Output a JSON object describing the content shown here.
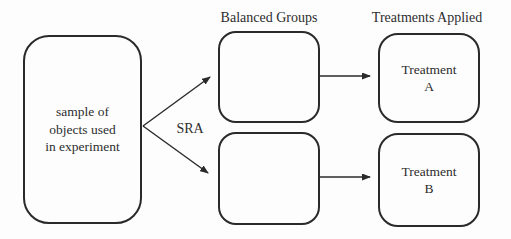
{
  "diagram": {
    "column_labels": {
      "balanced_groups": "Balanced Groups",
      "treatments_applied": "Treatments Applied"
    },
    "nodes": {
      "sample": {
        "label": "sample of\nobjects used\nin experiment"
      },
      "balanced_group_top": {
        "label": ""
      },
      "balanced_group_bottom": {
        "label": ""
      },
      "treatment_a": {
        "label": "Treatment\nA"
      },
      "treatment_b": {
        "label": "Treatment\nB"
      }
    },
    "edge_labels": {
      "sra": "SRA"
    },
    "colors": {
      "line": "#2a2a2a",
      "text": "#2d2d2d",
      "background": "#fdfdfd"
    }
  }
}
